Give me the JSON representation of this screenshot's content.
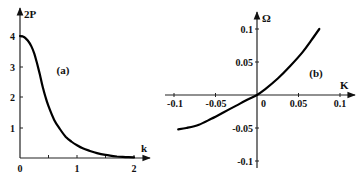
{
  "chart_data": [
    {
      "type": "line",
      "panel_label": "(a)",
      "title": "",
      "xlabel": "k",
      "ylabel": "2P",
      "xlim": [
        0,
        2.1
      ],
      "ylim": [
        0,
        4.5
      ],
      "x_ticks": [
        "0",
        "1",
        "2"
      ],
      "x_minor_ticks": [
        0.5,
        1.5
      ],
      "y_ticks": [
        "1",
        "2",
        "3",
        "4"
      ],
      "grid": false,
      "series": [
        {
          "name": "2P(k)",
          "x": [
            0,
            0.05,
            0.1,
            0.15,
            0.2,
            0.25,
            0.3,
            0.35,
            0.4,
            0.45,
            0.5,
            0.6,
            0.7,
            0.8,
            0.9,
            1.0,
            1.1,
            1.2,
            1.35,
            1.5,
            1.7,
            1.85,
            2.0
          ],
          "y": [
            4.0,
            3.98,
            3.92,
            3.82,
            3.66,
            3.42,
            3.1,
            2.72,
            2.32,
            1.98,
            1.7,
            1.25,
            0.95,
            0.7,
            0.54,
            0.42,
            0.32,
            0.25,
            0.16,
            0.1,
            0.05,
            0.03,
            0.02
          ]
        }
      ]
    },
    {
      "type": "line",
      "panel_label": "(b)",
      "title": "",
      "xlabel": "K",
      "ylabel": "Ω",
      "xlim": [
        -0.1,
        0.11
      ],
      "ylim": [
        -0.11,
        0.12
      ],
      "x_ticks": [
        "-0.1",
        "-0.05",
        "0",
        "0.05",
        "0.1"
      ],
      "y_ticks": [
        "0.1",
        "0.05",
        "-0.05",
        "-0.1"
      ],
      "grid": false,
      "series": [
        {
          "name": "Ω(K)",
          "x": [
            -0.095,
            -0.085,
            -0.07,
            -0.055,
            -0.04,
            -0.025,
            -0.01,
            0,
            0.01,
            0.025,
            0.04,
            0.055,
            0.065,
            0.075
          ],
          "y": [
            -0.052,
            -0.05,
            -0.045,
            -0.036,
            -0.026,
            -0.016,
            -0.006,
            0,
            0.009,
            0.025,
            0.044,
            0.065,
            0.082,
            0.1
          ]
        }
      ]
    }
  ],
  "panel_a": {
    "label": "(a)",
    "ylabel": "2P",
    "xlabel": "k",
    "yticks": [
      "4",
      "3",
      "2",
      "1"
    ],
    "xticks": [
      "0",
      "1",
      "2"
    ]
  },
  "panel_b": {
    "label": "(b)",
    "ylabel": "Ω",
    "xlabel": "K",
    "yticks": [
      "0.1",
      "0.05",
      "-0.05",
      "-0.1"
    ],
    "xticks": [
      "-0.1",
      "-0.05",
      "0",
      "0.05",
      "0.1"
    ]
  }
}
